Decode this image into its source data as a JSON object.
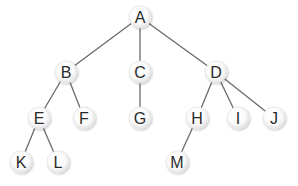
{
  "diagram": {
    "type": "tree",
    "nodes": [
      {
        "id": "A",
        "label": "A",
        "x": 140,
        "y": 17
      },
      {
        "id": "B",
        "label": "B",
        "x": 66,
        "y": 72
      },
      {
        "id": "C",
        "label": "C",
        "x": 140,
        "y": 72
      },
      {
        "id": "D",
        "label": "D",
        "x": 216,
        "y": 72
      },
      {
        "id": "E",
        "label": "E",
        "x": 39,
        "y": 118
      },
      {
        "id": "F",
        "label": "F",
        "x": 84,
        "y": 118
      },
      {
        "id": "G",
        "label": "G",
        "x": 140,
        "y": 118
      },
      {
        "id": "H",
        "label": "H",
        "x": 197,
        "y": 118
      },
      {
        "id": "I",
        "label": "I",
        "x": 238,
        "y": 118
      },
      {
        "id": "J",
        "label": "J",
        "x": 274,
        "y": 118
      },
      {
        "id": "K",
        "label": "K",
        "x": 21,
        "y": 162
      },
      {
        "id": "L",
        "label": "L",
        "x": 58,
        "y": 162
      },
      {
        "id": "M",
        "label": "M",
        "x": 177,
        "y": 162
      }
    ],
    "edges": [
      [
        "A",
        "B"
      ],
      [
        "A",
        "C"
      ],
      [
        "A",
        "D"
      ],
      [
        "B",
        "E"
      ],
      [
        "B",
        "F"
      ],
      [
        "C",
        "G"
      ],
      [
        "D",
        "H"
      ],
      [
        "D",
        "I"
      ],
      [
        "D",
        "J"
      ],
      [
        "E",
        "K"
      ],
      [
        "E",
        "L"
      ],
      [
        "H",
        "M"
      ]
    ],
    "colors": {
      "edge": "#6a6a6a",
      "node_fill_center": "#ffffff",
      "node_fill_edge": "#e4e4e4",
      "label": "#2a2a2a"
    }
  }
}
